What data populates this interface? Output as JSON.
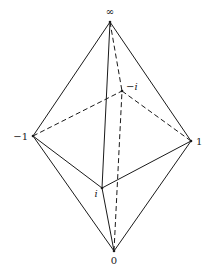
{
  "diagram": {
    "vertices": [
      {
        "id": "inf",
        "label": "∞",
        "x": 110,
        "y": 22,
        "label_x": 110,
        "label_y": 15,
        "italic": false,
        "anchor": "middle"
      },
      {
        "id": "zero",
        "label": "0",
        "x": 114,
        "y": 251,
        "label_x": 114,
        "label_y": 264,
        "italic": false,
        "anchor": "middle"
      },
      {
        "id": "neg1",
        "label": "−1",
        "x": 33,
        "y": 136,
        "label_x": 28,
        "label_y": 140,
        "italic": false,
        "anchor": "end"
      },
      {
        "id": "pos1",
        "label": "1",
        "x": 191,
        "y": 141,
        "label_x": 196,
        "label_y": 145,
        "italic": false,
        "anchor": "start"
      },
      {
        "id": "negi",
        "label": "−i",
        "x": 122,
        "y": 91,
        "label_x": 126,
        "label_y": 90,
        "italic": true,
        "anchor": "start"
      },
      {
        "id": "posi",
        "label": "i",
        "x": 102,
        "y": 188,
        "label_x": 96,
        "label_y": 197,
        "italic": true,
        "anchor": "middle"
      }
    ],
    "edges": [
      {
        "from": "inf",
        "to": "neg1",
        "style": "solid"
      },
      {
        "from": "inf",
        "to": "pos1",
        "style": "solid"
      },
      {
        "from": "inf",
        "to": "posi",
        "style": "solid"
      },
      {
        "from": "inf",
        "to": "negi",
        "style": "dashed"
      },
      {
        "from": "zero",
        "to": "neg1",
        "style": "solid"
      },
      {
        "from": "zero",
        "to": "pos1",
        "style": "solid"
      },
      {
        "from": "zero",
        "to": "posi",
        "style": "solid"
      },
      {
        "from": "zero",
        "to": "negi",
        "style": "dashed"
      },
      {
        "from": "neg1",
        "to": "posi",
        "style": "solid"
      },
      {
        "from": "posi",
        "to": "pos1",
        "style": "solid"
      },
      {
        "from": "neg1",
        "to": "negi",
        "style": "dashed"
      },
      {
        "from": "negi",
        "to": "pos1",
        "style": "dashed"
      }
    ],
    "colors": {
      "line": "#1a1a1a",
      "background": "#ffffff"
    }
  }
}
